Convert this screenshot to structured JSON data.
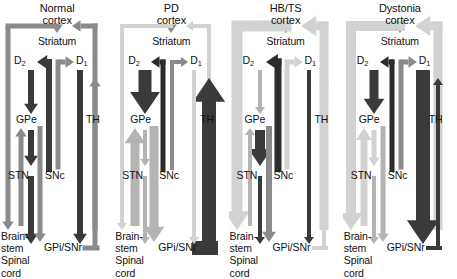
{
  "figure": {
    "type": "diagram",
    "panel_width_px": 114,
    "height_px": 274
  },
  "shades": {
    "very_light": "#d2d2d2",
    "light": "#b4b4b4",
    "medium": "#8a8a8a",
    "dark": "#6e6e6e",
    "very_dark": "#3a3a3a",
    "black": "#2b2b2b",
    "text": "#111111"
  },
  "node_labels": {
    "striatum": "Striatum",
    "d2": "D",
    "d2_sub": "2",
    "d1": "D",
    "d1_sub": "1",
    "gpe": "GPe",
    "stn": "STN",
    "snc": "SNc",
    "th": "TH",
    "gpi_snr": "GPi/SNr",
    "brainstem_line1": "Brain-",
    "brainstem_line2": "stem",
    "brainstem_line3": "Spinal",
    "brainstem_line4": "cord"
  },
  "panels": [
    {
      "id": "normal",
      "title_line1": "Normal",
      "title_line2": "cortex",
      "title_shade": "#111111",
      "pathways": {
        "cortex_to_striatum": {
          "shade": "#8a8a8a",
          "width": 5,
          "direction": "down",
          "label": "cortex to striatum"
        },
        "striatum_d2_to_gpe": {
          "shade": "#3a3a3a",
          "width": 6,
          "direction": "down",
          "label": "D2 striatum to GPe"
        },
        "gpe_to_stn": {
          "shade": "#3a3a3a",
          "width": 6,
          "direction": "down",
          "label": "GPe to STN"
        },
        "stn_to_gpi": {
          "shade": "#3a3a3a",
          "width": 6,
          "direction": "down",
          "label": "STN to GPi/SNr"
        },
        "striatum_d1_to_gpi": {
          "shade": "#3a3a3a",
          "width": 6,
          "direction": "down",
          "label": "D1 striatum to GPi/SNr"
        },
        "snc_to_striatum": {
          "shade": "#3a3a3a",
          "width": 6,
          "direction": "up",
          "label": "SNc to D2 striatum"
        },
        "snc_to_d1": {
          "shade": "#8a8a8a",
          "width": 5,
          "direction": "up",
          "label": "SNc to D1 striatum"
        },
        "gpi_to_th": {
          "shade": "#8a8a8a",
          "width": 5,
          "direction": "up",
          "label": "GPi/SNr to thalamus"
        },
        "th_to_cortex": {
          "shade": "#8a8a8a",
          "width": 5,
          "direction": "up",
          "label": "thalamus to cortex"
        },
        "cortex_to_brainstem": {
          "shade": "#8a8a8a",
          "width": 5,
          "direction": "down",
          "label": "cortex to brainstem/spinal cord"
        },
        "brainstem_to_gpe": {
          "shade": "#8a8a8a",
          "width": 5,
          "direction": "up",
          "label": "ascending to GPe"
        },
        "gpe_descending": {
          "shade": "#8a8a8a",
          "width": 5,
          "direction": "down",
          "label": "GPe descending"
        }
      }
    },
    {
      "id": "pd",
      "title_line1": "PD",
      "title_line2": "cortex",
      "title_shade": "#111111",
      "pathways": {
        "cortex_to_striatum": {
          "shade": "#8a8a8a",
          "width": 5,
          "direction": "down",
          "label": "cortex to striatum"
        },
        "striatum_d2_to_gpe": {
          "shade": "#3a3a3a",
          "width": 13,
          "direction": "down",
          "label": "D2 striatum to GPe (increased)"
        },
        "gpe_to_stn": {
          "shade": "#b4b4b4",
          "width": 4,
          "direction": "down",
          "label": "GPe to STN (decreased)"
        },
        "stn_to_gpi": {
          "shade": "#b4b4b4",
          "width": 4,
          "direction": "down",
          "label": "STN to GPi/SNr"
        },
        "striatum_d1_to_gpi": {
          "shade": "#d2d2d2",
          "width": 4,
          "direction": "down",
          "label": "D1 striatum to GPi/SNr (decreased)"
        },
        "snc_to_striatum": {
          "shade": "#2b2b2b",
          "width": 5,
          "direction": "up",
          "label": "SNc to D2 striatum"
        },
        "snc_to_d1": {
          "shade": "#8a8a8a",
          "width": 4,
          "direction": "up",
          "label": "SNc to D1 striatum"
        },
        "gpi_to_th": {
          "shade": "#3a3a3a",
          "width": 14,
          "direction": "up",
          "label": "GPi/SNr to thalamus (increased inhibition)"
        },
        "th_to_cortex": {
          "shade": "#d2d2d2",
          "width": 4,
          "direction": "up",
          "label": "thalamus to cortex (decreased)"
        },
        "cortex_to_brainstem": {
          "shade": "#d2d2d2",
          "width": 4,
          "direction": "down",
          "label": "cortex to brainstem/spinal cord (decreased)"
        },
        "brainstem_to_gpe": {
          "shade": "#b4b4b4",
          "width": 9,
          "direction": "up",
          "label": "ascending to GPe"
        },
        "gpe_descending": {
          "shade": "#b4b4b4",
          "width": 9,
          "direction": "down",
          "label": "GPe descending"
        }
      }
    },
    {
      "id": "hbts",
      "title_line1": "HB/TS",
      "title_line2": "cortex",
      "title_shade": "#111111",
      "pathways": {
        "cortex_to_striatum": {
          "shade": "#8a8a8a",
          "width": 5,
          "direction": "down",
          "label": "cortex to striatum"
        },
        "striatum_d2_to_gpe": {
          "shade": "#b4b4b4",
          "width": 4,
          "direction": "down",
          "label": "D2 striatum to GPe (decreased)"
        },
        "gpe_to_stn": {
          "shade": "#3a3a3a",
          "width": 10,
          "direction": "down",
          "label": "GPe to STN (increased)"
        },
        "stn_to_gpi": {
          "shade": "#3a3a3a",
          "width": 4,
          "direction": "down",
          "label": "STN to GPi/SNr"
        },
        "striatum_d1_to_gpi": {
          "shade": "#3a3a3a",
          "width": 4,
          "direction": "down",
          "label": "D1 striatum to GPi/SNr"
        },
        "snc_to_striatum": {
          "shade": "#2b2b2b",
          "width": 7,
          "direction": "up",
          "label": "SNc to D2 striatum (increased)"
        },
        "snc_to_d1": {
          "shade": "#d2d2d2",
          "width": 5,
          "direction": "up",
          "label": "SNc to D1 striatum"
        },
        "gpi_to_th": {
          "shade": "#d2d2d2",
          "width": 4,
          "direction": "up",
          "label": "GPi/SNr to thalamus (decreased)"
        },
        "th_to_cortex": {
          "shade": "#d2d2d2",
          "width": 9,
          "direction": "up",
          "label": "thalamus to cortex (increased)"
        },
        "cortex_to_brainstem": {
          "shade": "#d2d2d2",
          "width": 11,
          "direction": "down",
          "label": "cortex to brainstem/spinal cord (increased)"
        },
        "brainstem_to_gpe": {
          "shade": "#b4b4b4",
          "width": 4,
          "direction": "up",
          "label": "ascending to GPe"
        },
        "gpe_descending": {
          "shade": "#8a8a8a",
          "width": 6,
          "direction": "down",
          "label": "GPe descending"
        }
      }
    },
    {
      "id": "dystonia",
      "title_line1": "Dystonia",
      "title_line2": "cortex",
      "title_shade": "#111111",
      "pathways": {
        "cortex_to_striatum": {
          "shade": "#8a8a8a",
          "width": 5,
          "direction": "down",
          "label": "cortex to striatum"
        },
        "striatum_d2_to_gpe": {
          "shade": "#3a3a3a",
          "width": 9,
          "direction": "down",
          "label": "D2 striatum to GPe (increased)"
        },
        "gpe_to_stn": {
          "shade": "#d2d2d2",
          "width": 5,
          "direction": "down",
          "label": "GPe to STN (decreased)"
        },
        "stn_to_gpi": {
          "shade": "#b4b4b4",
          "width": 4,
          "direction": "down",
          "label": "STN to GPi/SNr (decreased)"
        },
        "striatum_d1_to_gpi": {
          "shade": "#3a3a3a",
          "width": 14,
          "direction": "down",
          "label": "D1 striatum to GPi/SNr (increased)"
        },
        "snc_to_striatum": {
          "shade": "#2b2b2b",
          "width": 5,
          "direction": "up",
          "label": "SNc to D2 striatum"
        },
        "snc_to_d1": {
          "shade": "#8a8a8a",
          "width": 5,
          "direction": "up",
          "label": "SNc to D1 striatum"
        },
        "gpi_to_th": {
          "shade": "#3a3a3a",
          "width": 4,
          "direction": "up",
          "label": "GPi/SNr to thalamus"
        },
        "th_to_cortex": {
          "shade": "#d2d2d2",
          "width": 9,
          "direction": "up",
          "label": "thalamus to cortex (increased)"
        },
        "cortex_to_brainstem": {
          "shade": "#d2d2d2",
          "width": 10,
          "direction": "down",
          "label": "cortex to brainstem/spinal cord (increased)"
        },
        "brainstem_to_gpe": {
          "shade": "#d2d2d2",
          "width": 7,
          "direction": "up",
          "label": "ascending to GPe"
        },
        "gpe_descending": {
          "shade": "#b4b4b4",
          "width": 5,
          "direction": "down",
          "label": "GPe descending"
        }
      }
    }
  ]
}
